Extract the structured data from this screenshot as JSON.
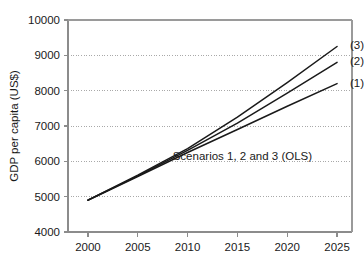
{
  "chart_data": {
    "type": "line",
    "title": "",
    "xlabel": "",
    "ylabel": "GDP per capita (US$)",
    "xlim": [
      1998,
      2026.5
    ],
    "ylim": [
      4000,
      10000
    ],
    "xticks": [
      2000,
      2005,
      2010,
      2015,
      2020,
      2025
    ],
    "xtick_labels": [
      "2000",
      "2005",
      "2010",
      "2015",
      "2020",
      "2025"
    ],
    "yticks": [
      4000,
      5000,
      6000,
      7000,
      8000,
      9000,
      10000
    ],
    "ytick_labels": [
      "4000",
      "5000",
      "6000",
      "7000",
      "8000",
      "9000",
      "10000"
    ],
    "grid": "horizontal-dotted",
    "legend": "inline-end-labels",
    "annotations": [
      {
        "text": "Scenarios 1, 2 and 3 (OLS)",
        "x": 2015.5,
        "y": 6150
      }
    ],
    "line_color": "#1a1a1a",
    "axis_color": "#808080",
    "grid_color": "#a9a9a9",
    "x": [
      2000,
      2005,
      2010,
      2015,
      2020,
      2025
    ],
    "series": [
      {
        "name": "(1)",
        "label": "(1)",
        "values": [
          4900,
          5570,
          6250,
          6900,
          7560,
          8200
        ],
        "end_label_x": 2026.3,
        "end_label_y": 8230
      },
      {
        "name": "(2)",
        "label": "(2)",
        "values": [
          4900,
          5590,
          6310,
          7080,
          7930,
          8800
        ],
        "end_label_x": 2026.3,
        "end_label_y": 8830
      },
      {
        "name": "(3)",
        "label": "(3)",
        "values": [
          4900,
          5610,
          6360,
          7250,
          8230,
          9250
        ],
        "end_label_x": 2026.3,
        "end_label_y": 9290
      }
    ]
  }
}
